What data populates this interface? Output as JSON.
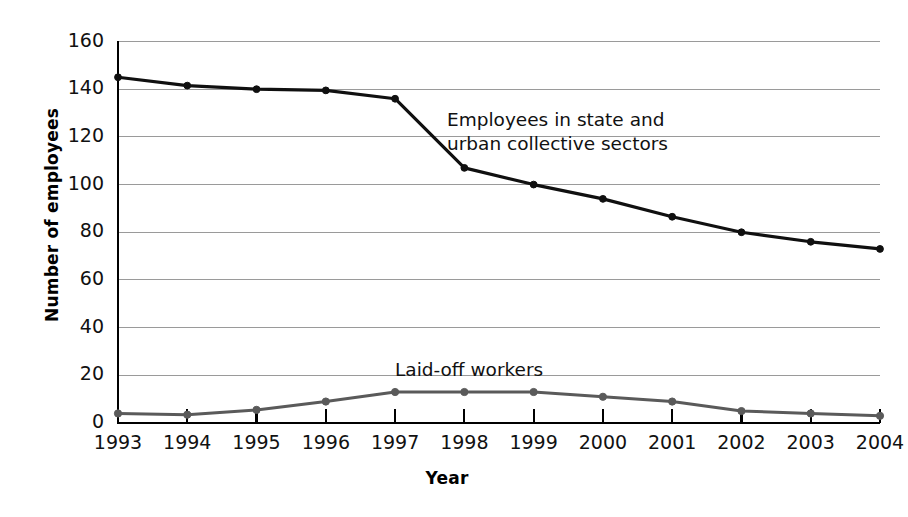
{
  "chart_data": {
    "type": "line",
    "title": "",
    "xlabel": "Year",
    "ylabel": "Number of employees",
    "categories": [
      "1993",
      "1994",
      "1995",
      "1996",
      "1997",
      "1998",
      "1999",
      "2000",
      "2001",
      "2002",
      "2003",
      "2004"
    ],
    "xlim": [
      1993,
      2004
    ],
    "ylim": [
      0,
      160
    ],
    "ytick_values": [
      0,
      20,
      40,
      60,
      80,
      100,
      120,
      140,
      160
    ],
    "ytick_labels": [
      "0",
      "20",
      "40",
      "60",
      "80",
      "100",
      "120",
      "140",
      "160"
    ],
    "grid": "horizontal",
    "legend": "none (inline annotations)",
    "series": [
      {
        "name": "Employees in state and urban collective sectors",
        "color": "#101010",
        "marker": "circle",
        "values": [
          145,
          141.5,
          140,
          139.5,
          136,
          107,
          100,
          94,
          86.5,
          80,
          76,
          73
        ]
      },
      {
        "name": "Laid-off workers",
        "color": "#5a5a5a",
        "marker": "circle",
        "values": [
          4,
          3.5,
          5.5,
          9,
          13,
          13,
          13,
          11,
          9,
          5,
          4,
          3
        ]
      }
    ],
    "annotations": [
      {
        "id": "main-series-label",
        "line1": "Employees in state and",
        "line2": "urban collective sectors"
      },
      {
        "id": "laid-off-series-label",
        "line1": "Laid-off workers",
        "line2": ""
      }
    ]
  },
  "colors": {
    "background": "#ffffff",
    "axis": "#000000",
    "gridline": "#9a9a9a",
    "series_main": "#101010",
    "series_laid_off": "#5a5a5a",
    "text": "#111111"
  }
}
